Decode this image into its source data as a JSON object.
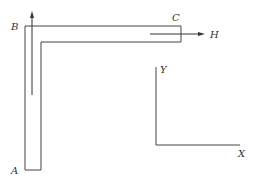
{
  "diagram": {
    "type": "L-shaped bar with flow arrows and coordinate axes",
    "colors": {
      "stroke": "#444444",
      "background": "#ffffff",
      "label": "#333333"
    },
    "points": {
      "A": {
        "label": "A"
      },
      "B": {
        "label": "B"
      },
      "C": {
        "label": "C"
      },
      "H": {
        "label": "H"
      }
    },
    "axes": {
      "y_label": "Y",
      "x_label": "X"
    },
    "arrows": [
      {
        "name": "vertical-flow-arrow",
        "direction": "up",
        "along": "A-B"
      },
      {
        "name": "horizontal-flow-arrow",
        "direction": "right",
        "along": "B-C",
        "points_to": "H"
      }
    ]
  }
}
